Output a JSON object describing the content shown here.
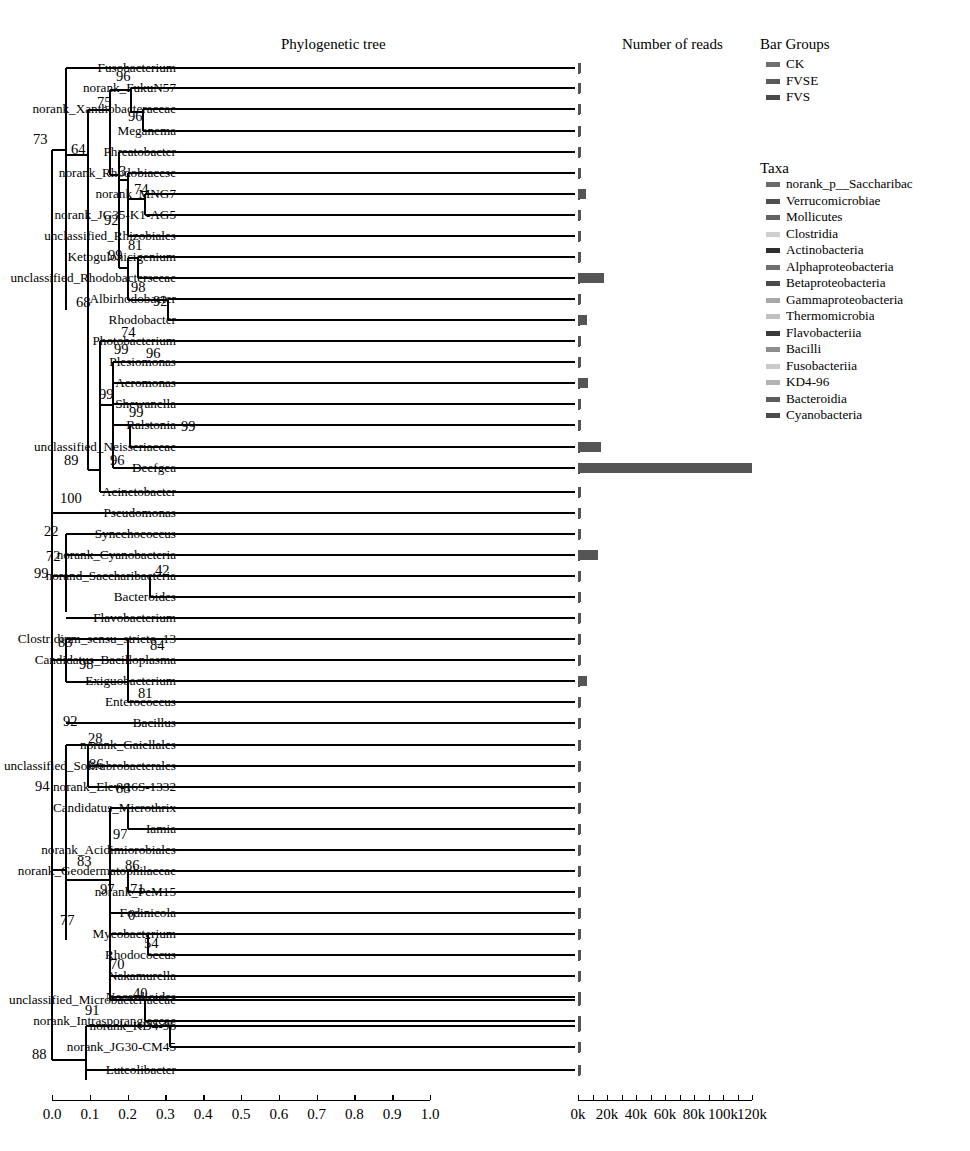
{
  "figure": {
    "tree_title": "Phylogenetic tree",
    "reads_title": "Number of reads"
  },
  "legend": {
    "groups_title": "Bar Groups",
    "taxa_title": "Taxa",
    "groups": [
      {
        "label": "CK",
        "color": "#6e6e6e"
      },
      {
        "label": "FVSE",
        "color": "#5a5a5a"
      },
      {
        "label": "FVS",
        "color": "#4a4a4a"
      }
    ],
    "taxa": [
      {
        "label": "norank_p__Saccharibac",
        "color": "#6a6a6a"
      },
      {
        "label": "Verrucomicrobiae",
        "color": "#4f4f4f"
      },
      {
        "label": "Mollicutes",
        "color": "#626262"
      },
      {
        "label": "Clostridia",
        "color": "#cfcfcf"
      },
      {
        "label": "Actinobacteria",
        "color": "#2e2e2e"
      },
      {
        "label": "Alphaproteobacteria",
        "color": "#707070"
      },
      {
        "label": "Betaproteobacteria",
        "color": "#4a4a4a"
      },
      {
        "label": "Gammaproteobacteria",
        "color": "#a8a8a8"
      },
      {
        "label": "Thermomicrobia",
        "color": "#c0c0c0"
      },
      {
        "label": "Flavobacteriia",
        "color": "#3a3a3a"
      },
      {
        "label": "Bacilli",
        "color": "#8e8e8e"
      },
      {
        "label": "Fusobacteriia",
        "color": "#cacaca"
      },
      {
        "label": "KD4-96",
        "color": "#b4b4b4"
      },
      {
        "label": "Bacteroidia",
        "color": "#5c5c5c"
      },
      {
        "label": "Cyanobacteria",
        "color": "#4a4a4a"
      }
    ]
  },
  "chart_data": {
    "type": "bar",
    "title": "Number of reads",
    "xlabel": "",
    "ylabel": "",
    "xlim": [
      0,
      130000
    ],
    "grid": false,
    "legend_position": "right",
    "tick_labels": [
      "0k",
      "20k",
      "40k",
      "60k",
      "80k",
      "100k",
      "120k"
    ],
    "tick_values": [
      0,
      20000,
      40000,
      60000,
      80000,
      100000,
      120000
    ],
    "categories": [
      "Fusobacterium",
      "norank_FukuN57",
      "norank_Xanthobacteraceae",
      "Meganema",
      "Phreatobacter",
      "norank_Rhodobiacese",
      "norank_MNG7",
      "norank_JG35-K1-AG5",
      "unclassified_Rhizobiales",
      "Ketogulonicigenium",
      "unclassified_Rhodobactersceae",
      "Albirhodobacter",
      "Rhodobacter",
      "Photobacterium",
      "Plesiomonas",
      "Aeromonas",
      "Shewanella",
      "Ralstonia",
      "unclassified_Neisseriaceae",
      "Deefgea",
      "Acinetobacter",
      "Pseudomonas",
      "Synechococcus",
      "norank_Cyanobacteria",
      "norand_Saccharibacteria",
      "Bacteroides",
      "Flavobacterium",
      "Clostridium_sensu_stricto_13",
      "Candidatus_Bacilloplasma",
      "Exiguobacterium",
      "Enterococcus",
      "Bacillus",
      "norank_Gaiellales",
      "unclassified_Solirubrobacterales",
      "norank_Elev-16S-1332",
      "Candidatus_Microthrix",
      "Iamia",
      "norank_Acidimiorobiales",
      "norank_Geodermatophilaceae",
      "norank_PeM15",
      "Fodinicola",
      "Mycobacterium",
      "Rhodococcus",
      "Nakamurella",
      "Nocardioides",
      "unclassified_Microbacteriaceae",
      "norank_Intrasporangiaceae",
      "norank_KD4-96",
      "norank_JG30-CM45",
      "Luteolibacter"
    ],
    "values": [
      700,
      900,
      500,
      700,
      900,
      800,
      5500,
      600,
      900,
      1000,
      18000,
      900,
      6000,
      500,
      1300,
      7000,
      900,
      700,
      16000,
      120000,
      800,
      900,
      600,
      14000,
      700,
      600,
      500,
      500,
      1000,
      6500,
      600,
      600,
      700,
      500,
      600,
      600,
      900,
      1000,
      900,
      800,
      700,
      800,
      900,
      700,
      500,
      500,
      500,
      1000,
      600,
      600
    ]
  },
  "tree_axis": {
    "labels": [
      "0.0",
      "0.1",
      "0.2",
      "0.3",
      "0.4",
      "0.5",
      "0.6",
      "0.7",
      "0.8",
      "0.9",
      "1.0"
    ],
    "values": [
      0.0,
      0.1,
      0.2,
      0.3,
      0.4,
      0.5,
      0.6,
      0.7,
      0.8,
      0.9,
      1.0
    ]
  },
  "bootstraps": [
    {
      "value": "73",
      "x": 33,
      "y": 140
    },
    {
      "value": "64",
      "x": 71,
      "y": 150
    },
    {
      "value": "96",
      "x": 116,
      "y": 77
    },
    {
      "value": "75",
      "x": 97,
      "y": 103
    },
    {
      "value": "96",
      "x": 128,
      "y": 117
    },
    {
      "value": "3",
      "x": 119,
      "y": 172
    },
    {
      "value": "74",
      "x": 134,
      "y": 190
    },
    {
      "value": "92",
      "x": 104,
      "y": 221
    },
    {
      "value": "81",
      "x": 128,
      "y": 246
    },
    {
      "value": "99",
      "x": 108,
      "y": 256
    },
    {
      "value": "98",
      "x": 131,
      "y": 288
    },
    {
      "value": "92",
      "x": 153,
      "y": 302
    },
    {
      "value": "68",
      "x": 76,
      "y": 303
    },
    {
      "value": "74",
      "x": 121,
      "y": 333
    },
    {
      "value": "99",
      "x": 114,
      "y": 350
    },
    {
      "value": "96",
      "x": 146,
      "y": 354
    },
    {
      "value": "99",
      "x": 99,
      "y": 395
    },
    {
      "value": "99",
      "x": 129,
      "y": 413
    },
    {
      "value": "99",
      "x": 181,
      "y": 427
    },
    {
      "value": "89",
      "x": 64,
      "y": 461
    },
    {
      "value": "96",
      "x": 110,
      "y": 461
    },
    {
      "value": "100",
      "x": 60,
      "y": 499
    },
    {
      "value": "22",
      "x": 44,
      "y": 532
    },
    {
      "value": "72",
      "x": 46,
      "y": 557
    },
    {
      "value": "99",
      "x": 34,
      "y": 574
    },
    {
      "value": "42",
      "x": 155,
      "y": 571
    },
    {
      "value": "83",
      "x": 58,
      "y": 643
    },
    {
      "value": "98",
      "x": 79,
      "y": 665
    },
    {
      "value": "84",
      "x": 150,
      "y": 646
    },
    {
      "value": "81",
      "x": 138,
      "y": 694
    },
    {
      "value": "92",
      "x": 63,
      "y": 722
    },
    {
      "value": "28",
      "x": 88,
      "y": 739
    },
    {
      "value": "94",
      "x": 35,
      "y": 787
    },
    {
      "value": "86",
      "x": 89,
      "y": 765
    },
    {
      "value": "88",
      "x": 116,
      "y": 789
    },
    {
      "value": "83",
      "x": 77,
      "y": 862
    },
    {
      "value": "97",
      "x": 113,
      "y": 835
    },
    {
      "value": "86",
      "x": 125,
      "y": 866
    },
    {
      "value": "97",
      "x": 100,
      "y": 890
    },
    {
      "value": "71",
      "x": 130,
      "y": 890
    },
    {
      "value": "0",
      "x": 128,
      "y": 916
    },
    {
      "value": "54",
      "x": 144,
      "y": 944
    },
    {
      "value": "70",
      "x": 110,
      "y": 965
    },
    {
      "value": "40",
      "x": 133,
      "y": 994
    },
    {
      "value": "77",
      "x": 60,
      "y": 921
    },
    {
      "value": "91",
      "x": 85,
      "y": 1011
    },
    {
      "value": "88",
      "x": 32,
      "y": 1055
    }
  ]
}
